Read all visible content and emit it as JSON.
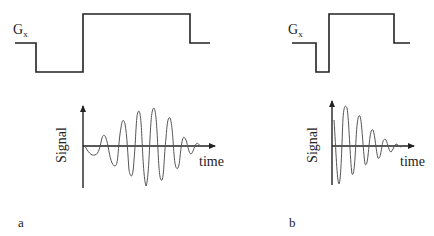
{
  "panels": [
    {
      "id": "a",
      "label": "a",
      "gradient_label": "G",
      "gradient_subscript": "x",
      "signal_axis_label": "Signal",
      "time_axis_label": "time",
      "description": "Gradient with long negative lobe; echo signal builds then decays (symmetric echo)"
    },
    {
      "id": "b",
      "label": "b",
      "gradient_label": "G",
      "gradient_subscript": "x",
      "signal_axis_label": "Signal",
      "time_axis_label": "time",
      "description": "Gradient with short negative lobe; signal peaks early and decays"
    }
  ],
  "colors": {
    "line": "#222222",
    "signal_wave": "#555555"
  }
}
